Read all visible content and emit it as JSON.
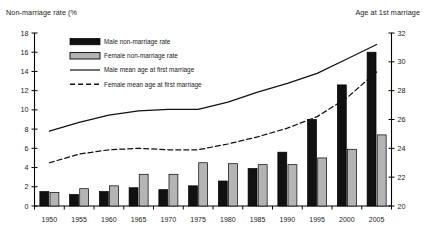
{
  "chart_data": {
    "type": "bar",
    "title": "",
    "categories": [
      "1950",
      "1955",
      "1960",
      "1965",
      "1970",
      "1975",
      "1980",
      "1985",
      "1990",
      "1995",
      "2000",
      "2005"
    ],
    "xlabel": "",
    "ylabel": "Non-marriage rate (%)",
    "ylabel_right": "Age at 1st marriage",
    "ylim": [
      0,
      18
    ],
    "ylim_right": [
      20,
      32
    ],
    "ytick_values": [
      0,
      2,
      4,
      6,
      8,
      10,
      12,
      14,
      16,
      18
    ],
    "ytick_values_right": [
      20,
      22,
      24,
      26,
      28,
      30,
      32
    ],
    "grid": false,
    "legend_position": "upper-left-inside",
    "series": [
      {
        "name": "Male non-marriage rate",
        "kind": "bar",
        "axis": "left",
        "color": "#111111",
        "values": [
          1.5,
          1.2,
          1.5,
          1.9,
          1.7,
          2.1,
          2.6,
          3.9,
          5.6,
          9.0,
          12.6,
          16.0
        ]
      },
      {
        "name": "Female non-marriage rate",
        "kind": "bar",
        "axis": "left",
        "color": "#b4b4b4",
        "values": [
          1.4,
          1.8,
          2.1,
          3.3,
          3.3,
          4.5,
          4.4,
          4.3,
          4.3,
          5.0,
          5.9,
          7.4
        ]
      },
      {
        "name": "Male mean age at first marriage",
        "kind": "line",
        "axis": "right",
        "style": "solid",
        "color": "#111111",
        "values": [
          25.2,
          25.8,
          26.3,
          26.6,
          26.7,
          26.7,
          27.2,
          27.9,
          28.5,
          29.2,
          30.2,
          31.2
        ]
      },
      {
        "name": "Female mean age at first marriage",
        "kind": "line",
        "axis": "right",
        "style": "dashed",
        "color": "#111111",
        "values": [
          23.0,
          23.6,
          23.9,
          24.0,
          23.9,
          23.9,
          24.3,
          24.8,
          25.4,
          26.2,
          27.5,
          29.3
        ]
      }
    ],
    "legend_entries": [
      {
        "label": "Male non-marriage rate",
        "marker": "filled-black-bar"
      },
      {
        "label": "Female non-marriage rate",
        "marker": "filled-gray-bar"
      },
      {
        "label": "Male mean age at first marriage",
        "marker": "solid-line"
      },
      {
        "label": "Female mean age at first marriage",
        "marker": "dashed-line"
      }
    ]
  },
  "axes": {
    "left_title": "Non-marriage rate (%",
    "right_title": "Age at 1st marriage"
  }
}
